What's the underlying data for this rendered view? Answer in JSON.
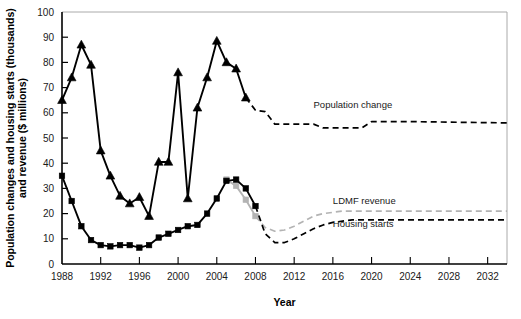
{
  "chart_data": {
    "type": "line",
    "title": "",
    "xlabel": "Year",
    "ylabel": "Population changes and housing starts (thousands)\nand revenue ($ millions)",
    "ylabel_line1": "Population changes and housing starts (thousands)",
    "ylabel_line2": "and revenue ($ millions)",
    "xlim": [
      1988,
      2034
    ],
    "ylim": [
      0,
      100
    ],
    "ytick_step": 10,
    "xtick_step": 4,
    "grid": false,
    "legend_position": "inline-right-labels",
    "yticks": [
      0,
      10,
      20,
      30,
      40,
      50,
      60,
      70,
      80,
      90,
      100
    ],
    "xticks": [
      1988,
      1992,
      1996,
      2000,
      2004,
      2008,
      2012,
      2016,
      2020,
      2024,
      2028,
      2032
    ],
    "xtick_labels": [
      "1988",
      "1992",
      "1996",
      "2000",
      "2004",
      "2008",
      "2012",
      "2016",
      "2020",
      "2024",
      "2028",
      "2032"
    ],
    "ytick_labels": [
      "0",
      "10",
      "20",
      "30",
      "40",
      "50",
      "60",
      "70",
      "80",
      "90",
      "100"
    ],
    "series": [
      {
        "name": "Population change",
        "label": "Population change",
        "color": "#000000",
        "marker": "triangle",
        "historical_style": "solid",
        "forecast_style": "dashed",
        "label_x": 2014,
        "label_y": 62,
        "historical": {
          "x": [
            1988,
            1989,
            1990,
            1991,
            1992,
            1993,
            1994,
            1995,
            1996,
            1997,
            1998,
            1999,
            2000,
            2001,
            2002,
            2003,
            2004,
            2005,
            2006,
            2007
          ],
          "y": [
            65,
            74,
            87,
            79,
            45,
            35,
            27,
            24,
            26.5,
            19,
            40.5,
            40.5,
            76,
            26,
            62,
            74,
            88.5,
            80,
            77.5,
            66
          ]
        },
        "forecast": {
          "x": [
            2007,
            2008,
            2009,
            2010,
            2014,
            2015,
            2019,
            2020,
            2021,
            2024,
            2034
          ],
          "y": [
            66,
            61,
            60.5,
            55.5,
            55.5,
            54,
            54,
            56.5,
            56.5,
            56.5,
            56
          ]
        }
      },
      {
        "name": "Housing starts",
        "label": "Housing starts",
        "color": "#000000",
        "marker": "square",
        "historical_style": "solid",
        "forecast_style": "dashed",
        "label_x": 2016,
        "label_y": 14.5,
        "historical": {
          "x": [
            1988,
            1989,
            1990,
            1991,
            1992,
            1993,
            1994,
            1995,
            1996,
            1997,
            1998,
            1999,
            2000,
            2001,
            2002,
            2003,
            2004,
            2005,
            2006,
            2007,
            2008
          ],
          "y": [
            35,
            25,
            15,
            9.5,
            7.5,
            7,
            7.5,
            7.5,
            6.5,
            7.5,
            10.5,
            12,
            13.5,
            15,
            15.5,
            20,
            26,
            33,
            33.5,
            30,
            23
          ]
        },
        "forecast": {
          "x": [
            2008,
            2009,
            2010,
            2011,
            2012,
            2013,
            2014,
            2015,
            2016,
            2017,
            2018,
            2020,
            2024,
            2028,
            2034
          ],
          "y": [
            23,
            12,
            8.5,
            8.5,
            10,
            12,
            14,
            15.5,
            16.5,
            17,
            17.5,
            17.5,
            17.5,
            17.5,
            17.5
          ]
        }
      },
      {
        "name": "LDMF revenue",
        "label": "LDMF revenue",
        "color": "#b3b3b3",
        "marker": "square",
        "historical_style": "solid",
        "forecast_style": "dashed",
        "label_x": 2016,
        "label_y": 24,
        "historical": {
          "x": [
            2005,
            2006,
            2007,
            2008
          ],
          "y": [
            33.5,
            31,
            25.5,
            19
          ]
        },
        "forecast": {
          "x": [
            2008,
            2009,
            2010,
            2011,
            2012,
            2013,
            2014,
            2015,
            2016,
            2017,
            2018,
            2020,
            2024,
            2028,
            2034
          ],
          "y": [
            19,
            14.5,
            13,
            13.5,
            15,
            17,
            19,
            20,
            20.5,
            21,
            21,
            21,
            21,
            21,
            21
          ]
        }
      }
    ]
  }
}
